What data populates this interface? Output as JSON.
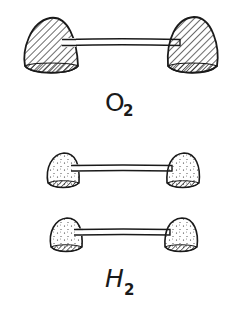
{
  "diagram": {
    "type": "gumdrop molecular models",
    "molecules": [
      {
        "id": "oxygen",
        "label": {
          "element": "O",
          "subscript": "2"
        },
        "atoms": [
          {
            "size": "large",
            "fill_style": "hatched"
          },
          {
            "size": "large",
            "fill_style": "hatched"
          }
        ],
        "bond": "stick"
      },
      {
        "id": "hydrogen-1",
        "atoms": [
          {
            "size": "small",
            "fill_style": "stippled"
          },
          {
            "size": "small",
            "fill_style": "stippled"
          }
        ],
        "bond": "stick"
      },
      {
        "id": "hydrogen-2",
        "label": {
          "element": "H",
          "subscript": "2"
        },
        "atoms": [
          {
            "size": "small",
            "fill_style": "stippled"
          },
          {
            "size": "small",
            "fill_style": "stippled"
          }
        ],
        "bond": "stick"
      }
    ]
  },
  "colors": {
    "ink": "#1a1a1a",
    "background": "#ffffff"
  }
}
